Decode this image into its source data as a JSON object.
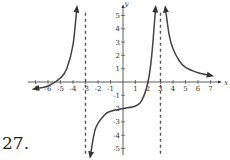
{
  "problem": {
    "number_label": "27."
  },
  "chart_data": {
    "type": "line",
    "title": "",
    "xlabel": "x",
    "ylabel": "y",
    "xlim": [
      -7.5,
      7.5
    ],
    "ylim": [
      -5.5,
      5.5
    ],
    "grid": false,
    "x_ticks": [
      -7,
      -6,
      -5,
      -4,
      -3,
      -2,
      -1,
      1,
      2,
      3,
      4,
      5,
      6,
      7
    ],
    "y_ticks": [
      -5,
      -4,
      -3,
      -2,
      -1,
      1,
      2,
      3,
      4,
      5
    ],
    "x_tick_labels": [
      "-7",
      "-6",
      "-5",
      "-4",
      "-3",
      "-2",
      "-1",
      "1",
      "2",
      "3",
      "4",
      "5",
      "6",
      "7"
    ],
    "y_tick_labels": [
      "-5",
      "-4",
      "-3",
      "-2",
      "-1",
      "1",
      "2",
      "3",
      "4",
      "5"
    ],
    "vertical_asymptotes": [
      -3,
      3
    ],
    "series": [
      {
        "name": "left-branch",
        "x": [
          -7,
          -6,
          -5,
          -4.5,
          -4,
          -3.7
        ],
        "y": [
          -0.5,
          -0.3,
          0.3,
          1.0,
          2.8,
          5.5
        ],
        "arrows": [
          "start",
          "end"
        ]
      },
      {
        "name": "middle-branch",
        "x": [
          -2.6,
          -2.2,
          -1.5,
          -1,
          0,
          1,
          1.5,
          2,
          2.3,
          2.6
        ],
        "y": [
          -5.5,
          -3.5,
          -2.5,
          -2.2,
          -2,
          -1.8,
          -1.4,
          0,
          2,
          5.5
        ],
        "arrows": [
          "start",
          "end"
        ]
      },
      {
        "name": "right-branch",
        "x": [
          3.4,
          3.7,
          4,
          4.5,
          5,
          6,
          7
        ],
        "y": [
          5.5,
          3.5,
          2.5,
          1.6,
          1.1,
          0.7,
          0.5
        ],
        "arrows": [
          "start",
          "end"
        ]
      }
    ]
  },
  "colors": {
    "curve": "#444444",
    "axis": "#333333",
    "asymptote": "#555555"
  }
}
